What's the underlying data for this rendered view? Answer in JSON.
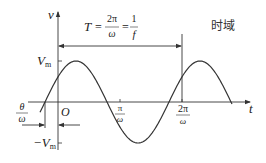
{
  "diagram": {
    "title": "时域",
    "axes": {
      "y_label": "v",
      "x_label": "t",
      "origin_label": "O"
    },
    "y_ticks": {
      "max_label": "V",
      "max_sub": "m",
      "min_label": "−V",
      "min_sub": "m"
    },
    "x_ticks": [
      {
        "num": "π",
        "den": "ω"
      },
      {
        "num": "2π",
        "den": "ω"
      }
    ],
    "phase_label": {
      "num": "θ",
      "den": "ω"
    },
    "period_formula": {
      "lhs": "T",
      "eq1": "=",
      "frac1_num": "2π",
      "frac1_den": "ω",
      "eq2": "=",
      "frac2_num": "1",
      "frac2_den": "f"
    },
    "colors": {
      "stroke": "#333333",
      "background": "#ffffff"
    }
  }
}
